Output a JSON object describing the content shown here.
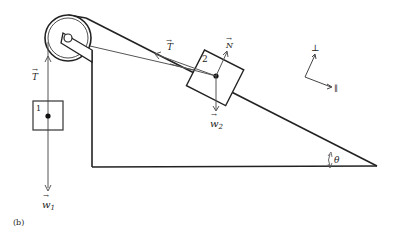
{
  "figure": {
    "panel_label": "(b)",
    "block1": {
      "label": "1"
    },
    "block2": {
      "label": "2"
    },
    "forces": {
      "tension_left": "T",
      "tension_incline": "T",
      "normal": "N",
      "weight1": "w",
      "weight1_sub": "1",
      "weight2": "w",
      "weight2_sub": "2"
    },
    "axes": {
      "perp": "⊥",
      "parallel": "∥"
    },
    "angle": "θ",
    "colors": {
      "line": "#222222",
      "force": "#555555"
    }
  }
}
